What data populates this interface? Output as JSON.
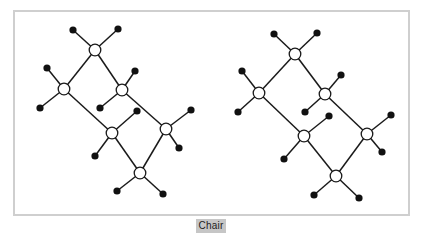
{
  "caption": {
    "label": "Chair"
  },
  "colors": {
    "frame": "#cfcfcf",
    "bond": "#1a1a1a",
    "carbon_fill": "#ffffff",
    "hydrogen_fill": "#111111",
    "caption_bg": "#c6c6c6"
  },
  "molecules": [
    {
      "name": "chair-left",
      "carbons": [
        [
          95,
          50
        ],
        [
          64,
          89
        ],
        [
          122,
          90
        ],
        [
          112,
          133
        ],
        [
          166,
          129
        ],
        [
          140,
          173
        ]
      ],
      "ring_bonds": [
        [
          0,
          1
        ],
        [
          0,
          2
        ],
        [
          1,
          3
        ],
        [
          2,
          4
        ],
        [
          3,
          5
        ],
        [
          4,
          5
        ]
      ],
      "hydrogens": [
        {
          "c": 0,
          "pos": [
            73,
            30
          ]
        },
        {
          "c": 0,
          "pos": [
            118,
            29
          ]
        },
        {
          "c": 1,
          "pos": [
            47,
            68
          ]
        },
        {
          "c": 1,
          "pos": [
            40,
            108
          ]
        },
        {
          "c": 2,
          "pos": [
            135,
            71
          ]
        },
        {
          "c": 2,
          "pos": [
            100,
            108
          ]
        },
        {
          "c": 3,
          "pos": [
            137,
            111
          ]
        },
        {
          "c": 3,
          "pos": [
            95,
            156
          ]
        },
        {
          "c": 4,
          "pos": [
            191,
            110
          ]
        },
        {
          "c": 4,
          "pos": [
            179,
            148
          ]
        },
        {
          "c": 5,
          "pos": [
            117,
            191
          ]
        },
        {
          "c": 5,
          "pos": [
            163,
            194
          ]
        }
      ]
    },
    {
      "name": "chair-right",
      "carbons": [
        [
          295,
          54
        ],
        [
          259,
          93
        ],
        [
          325,
          94
        ],
        [
          304,
          136
        ],
        [
          367,
          134
        ],
        [
          336,
          176
        ]
      ],
      "ring_bonds": [
        [
          0,
          1
        ],
        [
          0,
          2
        ],
        [
          1,
          3
        ],
        [
          2,
          4
        ],
        [
          3,
          5
        ],
        [
          4,
          5
        ]
      ],
      "hydrogens": [
        {
          "c": 0,
          "pos": [
            274,
            34
          ]
        },
        {
          "c": 0,
          "pos": [
            317,
            33
          ]
        },
        {
          "c": 1,
          "pos": [
            242,
            71
          ]
        },
        {
          "c": 1,
          "pos": [
            238,
            112
          ]
        },
        {
          "c": 2,
          "pos": [
            341,
            75
          ]
        },
        {
          "c": 2,
          "pos": [
            305,
            112
          ]
        },
        {
          "c": 3,
          "pos": [
            329,
            116
          ]
        },
        {
          "c": 3,
          "pos": [
            284,
            159
          ]
        },
        {
          "c": 4,
          "pos": [
            391,
            115
          ]
        },
        {
          "c": 4,
          "pos": [
            382,
            152
          ]
        },
        {
          "c": 5,
          "pos": [
            314,
            195
          ]
        },
        {
          "c": 5,
          "pos": [
            359,
            198
          ]
        }
      ]
    }
  ]
}
